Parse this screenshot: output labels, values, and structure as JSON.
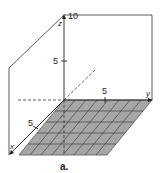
{
  "figure": {
    "caption": "a.",
    "axes": {
      "x": {
        "label": "x",
        "tick": "5"
      },
      "y": {
        "label": "y",
        "tick": "5"
      },
      "z": {
        "label": "z",
        "ticks": [
          "5",
          "10"
        ]
      }
    },
    "plane": {
      "fill": "#a6a6a6",
      "grid_rows": 5,
      "grid_cols": 8
    },
    "colors": {
      "line": "#333333",
      "plane": "#a6a6a6"
    }
  }
}
